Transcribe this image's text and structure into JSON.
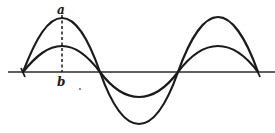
{
  "diagram": {
    "title": "",
    "colors": {
      "stroke": "#1a1a1a",
      "axis": "#2a2a2a",
      "background": "#ffffff"
    },
    "labels": {
      "a": "a",
      "b": "b"
    },
    "axis": {
      "y": 72,
      "x_start": 8,
      "x_end": 275
    },
    "zero_crossings_x": [
      23,
      100,
      178,
      258
    ],
    "waves": [
      {
        "name": "large-wave",
        "amplitude": 54,
        "period_px": 155
      },
      {
        "name": "small-wave",
        "amplitude": 26,
        "period_px": 155
      }
    ],
    "marker": {
      "x": 62,
      "top_y": 15,
      "bottom_y": 72,
      "style": "dashed"
    }
  }
}
